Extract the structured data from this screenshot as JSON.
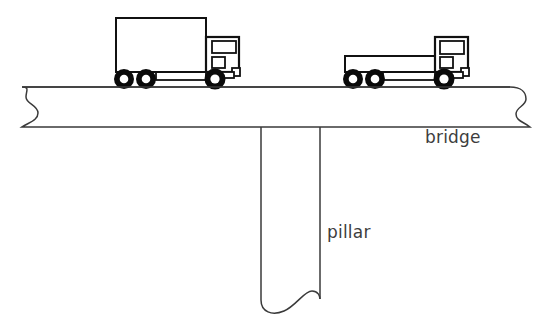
{
  "figure": {
    "type": "line-drawing-diagram",
    "background_color": "#ffffff",
    "line_color": "#1a1a1a",
    "label_color": "#3d3d3d",
    "tyre_color": "#0a0a0a"
  },
  "labels": {
    "bridge": "bridge",
    "pillar": "pillar"
  },
  "structures": {
    "bridge_deck": {
      "name": "bridge",
      "top_y": 86,
      "bottom_y": 128,
      "left_x": 18,
      "right_x": 534,
      "left_end": "wavy-break",
      "right_end": "wavy-break"
    },
    "pillar": {
      "name": "pillar",
      "left_x": 261,
      "right_x": 320,
      "top_y": 128,
      "bottom_y": 314,
      "bottom_end": "wavy-break"
    }
  },
  "vehicles": [
    {
      "name": "box-truck-left",
      "type": "box-body truck",
      "position": "left span of bridge",
      "axles": 3,
      "wheels": 3,
      "body": "enclosed box trailer",
      "cab_side": "right",
      "cab_windows": 2
    },
    {
      "name": "flatbed-truck-right",
      "type": "flatbed truck",
      "position": "right span of bridge",
      "axles": 3,
      "wheels": 3,
      "body": "open flat platform",
      "cab_side": "right",
      "cab_windows": 2
    }
  ],
  "icons": {
    "wavy_break": "break-line-icon",
    "wheel": "wheel-icon"
  }
}
